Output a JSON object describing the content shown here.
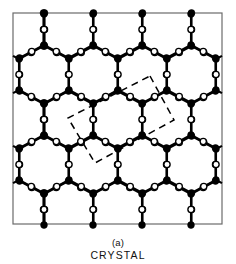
{
  "figure": {
    "panel_label": "(a)",
    "title": "CRYSTAL",
    "background_color": "#ffffff",
    "frame_color": "#6b6b6b",
    "bond_color": "#000000",
    "node_fill_color": "#000000",
    "bridge_fill_color": "#ffffff",
    "bridge_stroke_color": "#000000",
    "unitcell_stroke_color": "#000000",
    "frame": {
      "x": 13,
      "y": 13,
      "width": 209,
      "height": 211
    },
    "legend_semantics": {
      "filled_circle": "network-forming atom (Si)",
      "open_circle": "bridging atom (O)",
      "dashed_quadrilateral": "unit cell"
    }
  },
  "chart_data": {
    "type": "scatter",
    "title": "CRYSTAL",
    "subtitle": "(a)",
    "xlabel": "",
    "ylabel": "",
    "xlim": [
      13,
      222
    ],
    "ylim": [
      13,
      224
    ],
    "grid": false,
    "legend_position": "none",
    "lattice": {
      "hex_apex_columns_x": [
        44,
        93,
        142,
        191
      ],
      "hex_side_columns_x": [
        19,
        69,
        118,
        167,
        216
      ],
      "apex_rows_y": [
        45,
        135
      ],
      "upper_shoulder_rows_y": [
        58,
        148
      ],
      "lower_shoulder_rows_y": [
        91,
        181
      ],
      "bottom_apex_rows_y": [
        104,
        194
      ],
      "column_spacing_x": 49,
      "row_period_y": 90,
      "vertical_bond_length": 31,
      "node_radius": 3.4,
      "bridge_radius": 3.1,
      "bond_width": 2.1
    },
    "series": [
      {
        "name": "network-forming atoms (filled)",
        "marker": "filled-circle",
        "color": "#000000",
        "count": 60
      },
      {
        "name": "bridging atoms (open)",
        "marker": "open-circle",
        "color": "#ffffff",
        "count": 84
      }
    ],
    "annotations": [
      {
        "name": "unit-cell",
        "style": "dashed",
        "points": [
          [
            150,
            76
          ],
          [
            174,
            120
          ],
          [
            95,
            163
          ],
          [
            68,
            118
          ]
        ]
      }
    ]
  }
}
